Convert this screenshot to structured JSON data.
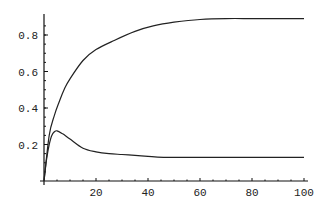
{
  "chart_data": {
    "type": "line",
    "title": "",
    "xlabel": "",
    "ylabel": "",
    "xlim": [
      0,
      100
    ],
    "ylim": [
      0,
      0.9
    ],
    "grid": false,
    "legend": null,
    "x_ticks": [
      20,
      40,
      60,
      80,
      100
    ],
    "x_tick_labels": [
      "20",
      "40",
      "60",
      "80",
      "100"
    ],
    "y_ticks": [
      0.2,
      0.4,
      0.6,
      0.8
    ],
    "y_tick_labels": [
      "0.2",
      "0.4",
      "0.6",
      "0.8"
    ],
    "series": [
      {
        "name": "upper",
        "x": [
          0,
          2,
          4,
          6,
          8,
          10,
          15,
          20,
          27,
          35,
          42,
          50,
          60,
          70,
          80,
          90,
          100
        ],
        "y": [
          0,
          0.25,
          0.36,
          0.44,
          0.51,
          0.56,
          0.66,
          0.72,
          0.77,
          0.82,
          0.85,
          0.87,
          0.885,
          0.89,
          0.89,
          0.89,
          0.89
        ]
      },
      {
        "name": "lower",
        "x": [
          0,
          1,
          2,
          3,
          4,
          5,
          7,
          10,
          15,
          20,
          25,
          30,
          35,
          40,
          46,
          60,
          80,
          100
        ],
        "y": [
          0,
          0.12,
          0.2,
          0.25,
          0.27,
          0.275,
          0.26,
          0.23,
          0.18,
          0.16,
          0.15,
          0.145,
          0.14,
          0.135,
          0.13,
          0.13,
          0.13,
          0.13
        ]
      }
    ]
  }
}
